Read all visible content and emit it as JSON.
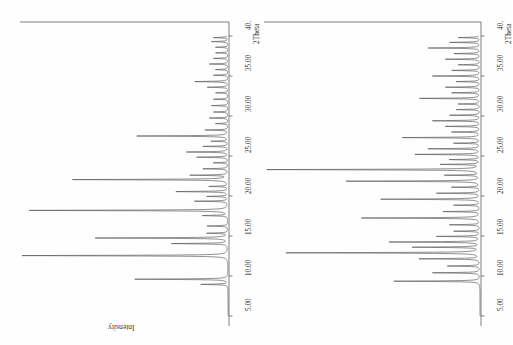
{
  "figure": {
    "background_color": "#ffffff",
    "line_color": "#555555",
    "axis_color": "#4a4a4a",
    "text_color": "#2b2b2b",
    "orientation_note": "rotated-90-ccw",
    "intensity_label": "Intensity",
    "twotheta_label": "2Theta",
    "tick_labels": [
      "5.00",
      "10.00",
      "15.00",
      "20.00",
      "25.00",
      "30.00",
      "35.00",
      "40."
    ],
    "tick_values": [
      5,
      10,
      15,
      20,
      25,
      30,
      35,
      40
    ]
  },
  "chart_data": [
    {
      "type": "line",
      "title": "",
      "panel": "left",
      "xlabel": "2Theta",
      "ylabel": "Intensity",
      "xlim": [
        5,
        40
      ],
      "ylim": [
        0,
        100
      ],
      "grid": false,
      "legend": "none",
      "x": [
        8.95,
        9.6,
        12.55,
        14.05,
        14.75,
        15.35,
        16.25,
        17.55,
        18.2,
        19.35,
        19.95,
        20.55,
        21.2,
        22.05,
        22.6,
        23.4,
        24.15,
        24.85,
        25.5,
        26.2,
        26.85,
        27.5,
        28.25,
        29.05,
        29.75,
        30.5,
        31.3,
        32.1,
        32.9,
        33.6,
        34.3,
        35.1,
        35.8,
        36.5,
        37.2,
        37.9,
        38.6,
        39.3,
        39.8
      ],
      "y": [
        13,
        45,
        100,
        27,
        64,
        10,
        10,
        12,
        96,
        16,
        10,
        25,
        9,
        75,
        18,
        12,
        7,
        15,
        20,
        12,
        8,
        44,
        11,
        6,
        9,
        7,
        8,
        7,
        6,
        10,
        16,
        7,
        6,
        9,
        7,
        6,
        6,
        8,
        7
      ]
    },
    {
      "type": "line",
      "title": "",
      "panel": "right",
      "xlabel": "2Theta",
      "ylabel": "Intensity",
      "xlim": [
        5,
        40
      ],
      "ylim": [
        0,
        100
      ],
      "grid": false,
      "legend": "none",
      "x": [
        9.35,
        10.4,
        11.25,
        12.15,
        12.9,
        13.6,
        14.25,
        14.95,
        15.6,
        16.4,
        17.25,
        18.05,
        18.85,
        19.6,
        20.35,
        21.1,
        21.85,
        22.6,
        23.3,
        23.95,
        24.55,
        25.2,
        25.9,
        26.6,
        27.3,
        28.0,
        28.7,
        29.4,
        30.1,
        30.8,
        31.5,
        32.2,
        32.9,
        33.6,
        34.3,
        35.0,
        35.7,
        36.4,
        37.1,
        37.8,
        38.5,
        39.2,
        39.8
      ],
      "y": [
        40,
        22,
        15,
        28,
        90,
        31,
        42,
        20,
        12,
        14,
        55,
        17,
        12,
        46,
        20,
        13,
        62,
        16,
        99,
        18,
        14,
        30,
        24,
        12,
        36,
        13,
        16,
        22,
        14,
        11,
        10,
        28,
        13,
        16,
        11,
        22,
        13,
        10,
        16,
        12,
        24,
        14,
        10
      ]
    }
  ]
}
